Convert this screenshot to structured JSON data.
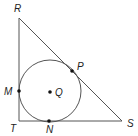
{
  "diagram": {
    "type": "geometry",
    "triangle": {
      "vertices": [
        {
          "name": "R",
          "x": 19,
          "y": 18,
          "label": "R",
          "lx": 14,
          "ly": 12
        },
        {
          "name": "T",
          "x": 19,
          "y": 121,
          "label": "T",
          "lx": 10,
          "ly": 132
        },
        {
          "name": "S",
          "x": 122,
          "y": 121,
          "label": "S",
          "lx": 127,
          "ly": 127
        }
      ]
    },
    "circle": {
      "center": "Q",
      "cx": 50,
      "cy": 91,
      "r": 31
    },
    "points": [
      {
        "name": "M",
        "x": 19,
        "y": 91,
        "label": "M",
        "lx": 4,
        "ly": 95
      },
      {
        "name": "N",
        "x": 49,
        "y": 121,
        "label": "N",
        "lx": 46,
        "ly": 133
      },
      {
        "name": "P",
        "x": 72,
        "y": 71,
        "label": "P",
        "lx": 77,
        "ly": 70
      },
      {
        "name": "Q",
        "x": 50,
        "y": 92,
        "label": "Q",
        "lx": 55,
        "ly": 96
      }
    ]
  }
}
